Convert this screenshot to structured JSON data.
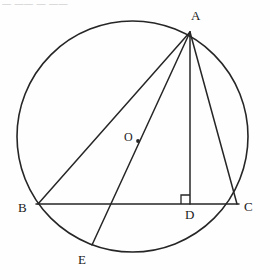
{
  "figure": {
    "background_color": "#fefefe",
    "stroke_color": "#262626",
    "header_fragment": "— —— — ——",
    "canvas": {
      "width": 270,
      "height": 280
    },
    "circle": {
      "name": "circumscribed-circle",
      "cx": 132.5,
      "cy": 136.5,
      "r": 115.5,
      "stroke_width": 1.6
    },
    "center_dot": {
      "name": "center-point-dot",
      "cx": 138,
      "cy": 141,
      "r": 1.9
    },
    "points": [
      {
        "id": "A",
        "label": "A",
        "x": 190,
        "y": 32,
        "label_x": 191,
        "label_y": 9
      },
      {
        "id": "B",
        "label": "B",
        "x": 38,
        "y": 204,
        "label_x": 18,
        "label_y": 201
      },
      {
        "id": "C",
        "label": "C",
        "x": 237,
        "y": 204,
        "label_x": 244,
        "label_y": 200
      },
      {
        "id": "D",
        "label": "D",
        "x": 190,
        "y": 204,
        "label_x": 185,
        "label_y": 208
      },
      {
        "id": "E",
        "label": "E",
        "x": 92,
        "y": 245,
        "label_x": 78,
        "label_y": 253
      },
      {
        "id": "O",
        "label": "O",
        "x": 138,
        "y": 141,
        "label_x": 124,
        "label_y": 131
      }
    ],
    "segments": [
      {
        "name": "segment-AB",
        "label": "AB",
        "x1": 190,
        "y1": 32,
        "x2": 38,
        "y2": 204
      },
      {
        "name": "segment-AC",
        "label": "AC",
        "x1": 190,
        "y1": 32,
        "x2": 237,
        "y2": 204
      },
      {
        "name": "segment-AD",
        "label": "AD",
        "x1": 190,
        "y1": 32,
        "x2": 190,
        "y2": 204
      },
      {
        "name": "segment-AE",
        "label": "AE",
        "x1": 190,
        "y1": 32,
        "x2": 92,
        "y2": 245
      },
      {
        "name": "segment-BC",
        "label": "BC",
        "x1": 36,
        "y1": 204,
        "x2": 239,
        "y2": 204
      }
    ],
    "right_angle_marker": {
      "name": "right-angle-marker-at-D",
      "label": "90°",
      "points": "181,204 181,195 190,195"
    }
  }
}
